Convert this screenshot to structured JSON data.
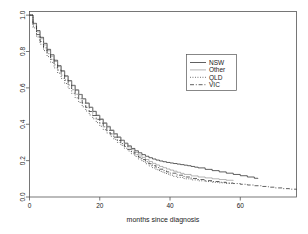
{
  "figure": {
    "background": "#ffffff",
    "frame_color": "#555555",
    "line_color": "#2b2b2b"
  },
  "chart_data": {
    "type": "line",
    "title": "",
    "subtitle": "",
    "xlabel": "months since diagnosis",
    "ylabel": "",
    "xlim": [
      0,
      76
    ],
    "ylim": [
      0,
      1.02
    ],
    "xticks": [
      0,
      20,
      40,
      60
    ],
    "xtick_labels": [
      "0",
      "20",
      "40",
      "60"
    ],
    "yticks": [
      0.0,
      0.2,
      0.4,
      0.6,
      0.8,
      1.0
    ],
    "ytick_labels": [
      "0.0",
      "0.2",
      "0.4",
      "0.6",
      "0.8",
      "1.0"
    ],
    "grid": false,
    "legend_position": "upper-right",
    "legend_entries": [
      "NSW",
      "Other",
      "QLD",
      "VIC"
    ],
    "series": [
      {
        "name": "NSW",
        "style": "solid",
        "color": "#2b2b2b",
        "x": [
          0,
          1,
          2,
          3,
          4,
          5,
          6,
          7,
          8,
          9,
          10,
          11,
          12,
          13,
          14,
          15,
          16,
          17,
          18,
          19,
          20,
          21,
          22,
          23,
          24,
          25,
          26,
          27,
          28,
          29,
          30,
          31,
          32,
          33,
          34,
          35,
          36,
          37,
          38,
          39,
          40,
          41,
          42,
          43,
          44,
          45,
          46,
          47,
          48,
          50,
          52,
          54,
          56,
          58,
          60,
          62,
          64,
          65
        ],
        "values": [
          1.0,
          0.955,
          0.915,
          0.878,
          0.845,
          0.812,
          0.782,
          0.752,
          0.722,
          0.694,
          0.666,
          0.64,
          0.614,
          0.589,
          0.564,
          0.54,
          0.516,
          0.493,
          0.47,
          0.448,
          0.427,
          0.406,
          0.386,
          0.366,
          0.347,
          0.329,
          0.312,
          0.296,
          0.281,
          0.267,
          0.254,
          0.243,
          0.233,
          0.224,
          0.216,
          0.209,
          0.203,
          0.198,
          0.194,
          0.19,
          0.187,
          0.184,
          0.181,
          0.178,
          0.175,
          0.172,
          0.168,
          0.164,
          0.16,
          0.152,
          0.145,
          0.138,
          0.131,
          0.124,
          0.117,
          0.11,
          0.103,
          0.1
        ]
      },
      {
        "name": "Other",
        "style": "solid-light",
        "color": "#8c8c8c",
        "x": [
          0,
          1,
          2,
          3,
          4,
          5,
          6,
          7,
          8,
          9,
          10,
          11,
          12,
          13,
          14,
          15,
          16,
          17,
          18,
          19,
          20,
          21,
          22,
          23,
          24,
          25,
          26,
          27,
          28,
          29,
          30,
          31,
          32,
          33,
          34,
          35,
          36,
          37,
          38,
          39,
          40,
          41,
          42,
          43,
          44,
          46,
          48,
          50,
          52,
          54,
          56,
          58
        ],
        "values": [
          1.0,
          0.952,
          0.908,
          0.87,
          0.836,
          0.804,
          0.774,
          0.745,
          0.717,
          0.69,
          0.663,
          0.637,
          0.612,
          0.587,
          0.563,
          0.54,
          0.517,
          0.494,
          0.472,
          0.451,
          0.43,
          0.409,
          0.389,
          0.369,
          0.349,
          0.33,
          0.311,
          0.293,
          0.276,
          0.26,
          0.245,
          0.231,
          0.218,
          0.206,
          0.195,
          0.185,
          0.176,
          0.168,
          0.161,
          0.154,
          0.148,
          0.142,
          0.136,
          0.13,
          0.124,
          0.116,
          0.11,
          0.105,
          0.1,
          0.096,
          0.092,
          0.09
        ]
      },
      {
        "name": "QLD",
        "style": "dotted",
        "color": "#2b2b2b",
        "x": [
          0,
          1,
          2,
          3,
          4,
          5,
          6,
          7,
          8,
          9,
          10,
          11,
          12,
          13,
          14,
          15,
          16,
          17,
          18,
          19,
          20,
          21,
          22,
          23,
          24,
          25,
          26,
          27,
          28,
          29,
          30,
          31,
          32,
          33,
          34,
          35,
          36,
          37,
          38,
          39,
          40,
          41,
          42,
          44,
          46,
          48,
          50,
          52,
          54,
          56,
          58
        ],
        "values": [
          1.0,
          0.93,
          0.88,
          0.84,
          0.805,
          0.772,
          0.74,
          0.71,
          0.681,
          0.652,
          0.624,
          0.597,
          0.57,
          0.545,
          0.52,
          0.496,
          0.473,
          0.451,
          0.43,
          0.409,
          0.389,
          0.37,
          0.352,
          0.334,
          0.317,
          0.3,
          0.284,
          0.268,
          0.253,
          0.238,
          0.223,
          0.209,
          0.196,
          0.183,
          0.171,
          0.16,
          0.15,
          0.141,
          0.133,
          0.126,
          0.12,
          0.114,
          0.108,
          0.1,
          0.094,
          0.089,
          0.085,
          0.081,
          0.078,
          0.075,
          0.073
        ]
      },
      {
        "name": "VIC",
        "style": "dashdot",
        "color": "#2b2b2b",
        "x": [
          0,
          1,
          2,
          3,
          4,
          5,
          6,
          7,
          8,
          9,
          10,
          11,
          12,
          13,
          14,
          15,
          16,
          17,
          18,
          19,
          20,
          21,
          22,
          23,
          24,
          25,
          26,
          27,
          28,
          29,
          30,
          31,
          32,
          33,
          34,
          35,
          36,
          37,
          38,
          39,
          40,
          42,
          44,
          46,
          48,
          50,
          52,
          54,
          56,
          58,
          60,
          62,
          64,
          66,
          68,
          70,
          72,
          74,
          76
        ],
        "values": [
          1.0,
          0.94,
          0.893,
          0.855,
          0.82,
          0.788,
          0.757,
          0.727,
          0.698,
          0.67,
          0.643,
          0.616,
          0.59,
          0.565,
          0.54,
          0.516,
          0.493,
          0.47,
          0.448,
          0.427,
          0.406,
          0.386,
          0.366,
          0.347,
          0.329,
          0.311,
          0.294,
          0.278,
          0.262,
          0.247,
          0.233,
          0.219,
          0.206,
          0.194,
          0.183,
          0.172,
          0.162,
          0.153,
          0.145,
          0.138,
          0.131,
          0.12,
          0.11,
          0.102,
          0.096,
          0.09,
          0.085,
          0.081,
          0.077,
          0.074,
          0.07,
          0.066,
          0.062,
          0.058,
          0.054,
          0.05,
          0.046,
          0.043,
          0.042
        ]
      }
    ]
  }
}
